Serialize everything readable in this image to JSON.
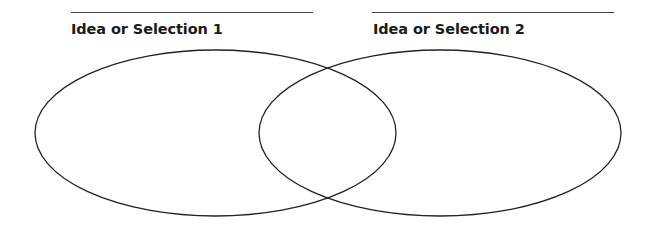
{
  "diagram": {
    "type": "venn",
    "sets": [
      {
        "id": "set-1",
        "label": "Idea or Selection 1",
        "write_line": {
          "x1": 71,
          "x2": 313,
          "y": 12
        },
        "label_pos": {
          "x": 71,
          "y": 21
        },
        "ellipse": {
          "cx": 215.5,
          "cy": 133,
          "rx": 180.5,
          "ry": 83
        }
      },
      {
        "id": "set-2",
        "label": "Idea or Selection 2",
        "write_line": {
          "x1": 372,
          "x2": 614,
          "y": 12
        },
        "label_pos": {
          "x": 373,
          "y": 21
        },
        "ellipse": {
          "cx": 440,
          "cy": 133,
          "rx": 181,
          "ry": 83
        }
      }
    ],
    "stroke_color": "#222222",
    "stroke_width": 1.3,
    "background": "#ffffff"
  }
}
